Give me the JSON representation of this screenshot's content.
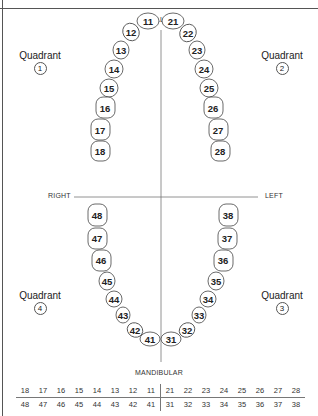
{
  "labels": {
    "top": "MAXILLARY",
    "bottom": "MANDIBULAR",
    "right_side": "RIGHT",
    "left_side": "LEFT"
  },
  "quadrants": [
    {
      "label": "Quadrant",
      "number": "1"
    },
    {
      "label": "Quadrant",
      "number": "2"
    },
    {
      "label": "Quadrant",
      "number": "3"
    },
    {
      "label": "Quadrant",
      "number": "4"
    }
  ],
  "teeth": {
    "q1": [
      "11",
      "12",
      "13",
      "14",
      "15",
      "16",
      "17",
      "18"
    ],
    "q2": [
      "21",
      "22",
      "23",
      "24",
      "25",
      "26",
      "27",
      "28"
    ],
    "q3": [
      "31",
      "32",
      "33",
      "34",
      "35",
      "36",
      "37",
      "38"
    ],
    "q4": [
      "41",
      "42",
      "43",
      "44",
      "45",
      "46",
      "47",
      "48"
    ]
  },
  "notation_table": {
    "upper_row": [
      "18",
      "17",
      "16",
      "15",
      "14",
      "13",
      "12",
      "11",
      "21",
      "22",
      "23",
      "24",
      "25",
      "26",
      "27",
      "28"
    ],
    "lower_row": [
      "48",
      "47",
      "46",
      "45",
      "44",
      "43",
      "42",
      "41",
      "31",
      "32",
      "33",
      "34",
      "35",
      "36",
      "37",
      "38"
    ]
  }
}
